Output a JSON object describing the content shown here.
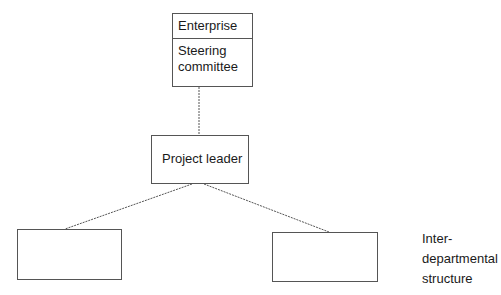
{
  "diagram": {
    "type": "organizational-structure",
    "nodes": {
      "top": {
        "enterprise_label": "Enterprise",
        "steering_label_line1": "Steering",
        "steering_label_line2": "committee"
      },
      "leader": {
        "label": "Project leader"
      },
      "left_unit": {
        "label": ""
      },
      "right_unit": {
        "label": ""
      }
    },
    "side_label": {
      "line1": "Inter-",
      "line2": "departmental",
      "line3": "structure"
    },
    "edges": [
      {
        "from": "top",
        "to": "leader",
        "style": "dashed"
      },
      {
        "from": "leader",
        "to": "left_unit",
        "style": "dashed"
      },
      {
        "from": "leader",
        "to": "right_unit",
        "style": "dashed"
      }
    ],
    "colors": {
      "stroke": "#555555",
      "background": "#ffffff",
      "text": "#1a1a1a"
    }
  }
}
